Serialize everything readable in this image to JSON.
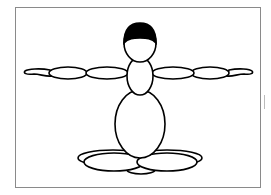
{
  "figure": {
    "colors": {
      "stroke": "#000000",
      "fill": "#ffffff",
      "hair": "#000000",
      "frame": "#8a8a8a"
    },
    "parts": [
      "hair",
      "head",
      "neck-torso",
      "body",
      "left-upper-arm",
      "left-forearm",
      "left-hand",
      "right-upper-arm",
      "right-forearm",
      "right-hand",
      "left-leg",
      "right-leg",
      "feet"
    ]
  },
  "caption": ""
}
